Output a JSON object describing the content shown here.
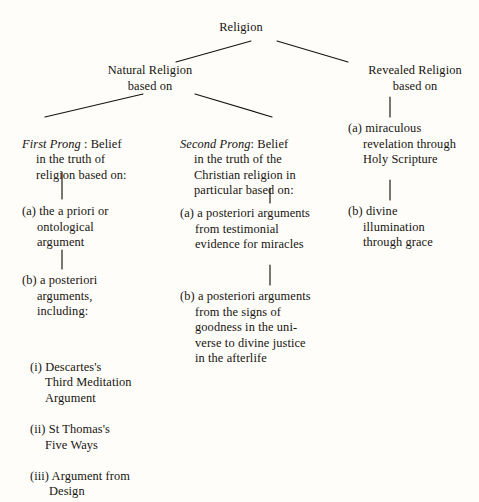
{
  "diagram": {
    "type": "tree",
    "title": "Religion",
    "background_color": "#fefdfa",
    "ink_color": "#17140f",
    "root": {
      "label": "Religion"
    },
    "level1": {
      "natural": "Natural Religion\nbased on",
      "revealed": "Revealed Religion\nbased on"
    },
    "natural_branch": {
      "first_prong": {
        "heading_italic": "First Prong",
        "heading_rest": " : Belief",
        "heading_lines": "in the truth of\nreligion based on:",
        "items": [
          "(a) the a priori or\nontological\nargument",
          "(b) a posteriori\narguments,\nincluding:"
        ],
        "sub_items": [
          "(i) Descartes's\nThird  Meditation\nArgument",
          "(ii) St Thomas's\nFive Ways",
          "(iii) Argument from\nDesign"
        ]
      },
      "second_prong": {
        "heading_italic": "Second Prong",
        "heading_rest": ": Belief",
        "heading_lines": "in the truth of the\nChristian religion in\nparticular based on:",
        "items": [
          "(a) a posteriori arguments\nfrom testimonial\nevidence for miracles",
          "(b) a posteriori arguments\nfrom the signs of\ngoodness in the uni-\nverse to divine justice\nin the afterlife"
        ]
      }
    },
    "revealed_branch": {
      "items": [
        "(a) miraculous\nrevelation through\nHoly Scripture",
        "(b) divine\nillumination\nthrough grace"
      ]
    }
  }
}
